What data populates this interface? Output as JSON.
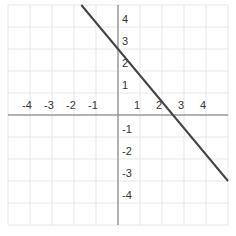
{
  "chart_data": {
    "type": "line",
    "title": "",
    "xlabel": "",
    "ylabel": "",
    "xlim": [
      -5,
      5
    ],
    "ylim": [
      -5,
      5
    ],
    "grid": true,
    "x_ticks": [
      -4,
      -3,
      -2,
      -1,
      1,
      2,
      3,
      4
    ],
    "y_ticks": [
      4,
      3,
      2,
      1,
      -1,
      -2,
      -3,
      -4
    ],
    "x_tick_labels": [
      "-4",
      "-3",
      "-2",
      "-1",
      "1",
      "2",
      "3",
      "4"
    ],
    "y_tick_labels": [
      "4",
      "3",
      "2",
      "1",
      "-1",
      "-2",
      "-3",
      "-4"
    ],
    "series": [
      {
        "name": "line",
        "equation": "y = -1.2x + 3",
        "x": [
          -1.667,
          0,
          2.5,
          5
        ],
        "y": [
          5,
          3,
          0,
          -3
        ],
        "color": "#444444"
      }
    ],
    "legend": null
  },
  "style": {
    "grid_color": "#e6e6e6",
    "axis_color": "#999999",
    "line_color": "#444444",
    "label_color": "#333333"
  }
}
